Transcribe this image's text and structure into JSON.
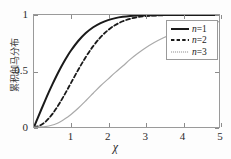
{
  "chart_data": {
    "type": "line",
    "title": "",
    "xlabel": "χ",
    "ylabel": "累积伽马分布",
    "xlim": [
      0,
      5
    ],
    "ylim": [
      0,
      1
    ],
    "xticks": [
      "1",
      "2",
      "3",
      "4",
      "5"
    ],
    "xtick_values": [
      1,
      2,
      3,
      4,
      5
    ],
    "yticks": [
      "0",
      "0.5",
      "1"
    ],
    "ytick_values": [
      0,
      0.5,
      1
    ],
    "grid": false,
    "legend_position": "upper right",
    "x": [
      0,
      0.1,
      0.2,
      0.3,
      0.4,
      0.5,
      0.6,
      0.7,
      0.8,
      0.9,
      1.0,
      1.2,
      1.4,
      1.6,
      1.8,
      2.0,
      2.2,
      2.4,
      2.6,
      2.8,
      3.0,
      3.25,
      3.5,
      3.75,
      4.0,
      4.5,
      5.0
    ],
    "series": [
      {
        "name": "n=1",
        "label": "n=1",
        "n": 1,
        "color": "#1a1a1a",
        "style": "solid",
        "width": 2.0,
        "values": [
          0.0,
          0.0797,
          0.1585,
          0.2358,
          0.3108,
          0.3829,
          0.4515,
          0.5161,
          0.5763,
          0.6319,
          0.6827,
          0.7699,
          0.8385,
          0.8904,
          0.9281,
          0.9545,
          0.9722,
          0.9836,
          0.9907,
          0.9949,
          0.9973,
          0.9988,
          0.9995,
          0.9998,
          0.9999,
          1.0,
          1.0
        ]
      },
      {
        "name": "n=2",
        "label": "n=2",
        "n": 2,
        "color": "#1a1a1a",
        "style": "dashed",
        "width": 1.8,
        "values": [
          0.0,
          0.005,
          0.0198,
          0.044,
          0.0769,
          0.1175,
          0.1647,
          0.2173,
          0.2739,
          0.333,
          0.3935,
          0.5132,
          0.6247,
          0.722,
          0.8021,
          0.8647,
          0.9111,
          0.9443,
          0.9665,
          0.9807,
          0.9889,
          0.9949,
          0.9978,
          0.9991,
          0.9997,
          1.0,
          1.0
        ]
      },
      {
        "name": "n=3",
        "label": "n=3",
        "n": 3,
        "color": "#aaaaaa",
        "style": "thin",
        "width": 1.2,
        "values": [
          0.0,
          0.0002,
          0.0012,
          0.004,
          0.0092,
          0.0176,
          0.0294,
          0.0448,
          0.0638,
          0.0862,
          0.1116,
          0.1696,
          0.2343,
          0.3016,
          0.3685,
          0.4276,
          0.4877,
          0.5443,
          0.6037,
          0.6556,
          0.7029,
          0.7538,
          0.797,
          0.8319,
          0.8614,
          0.9108,
          0.9415
        ]
      }
    ]
  },
  "legend": {
    "entries": [
      {
        "prefix": "n",
        "text": "=1",
        "full": "n=1",
        "style": "solid"
      },
      {
        "prefix": "n",
        "text": "=2",
        "full": "n=2",
        "style": "dashed"
      },
      {
        "prefix": "n",
        "text": "=3",
        "full": "n=3",
        "style": "dotted"
      }
    ]
  },
  "colors": {
    "curve_primary": "#1a1a1a",
    "curve_tertiary": "#aaaaaa",
    "frame": "#9a9a9a",
    "background": "#ffffff",
    "text": "#2b2b2b"
  }
}
